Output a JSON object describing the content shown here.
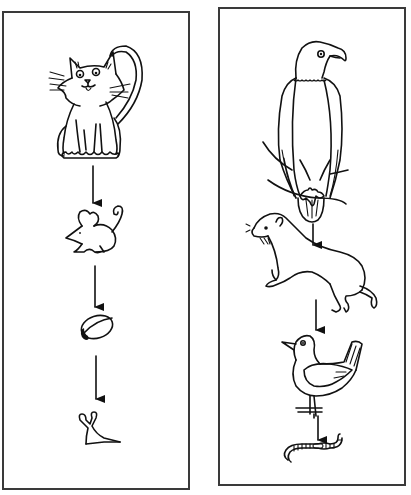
{
  "diagram": {
    "type": "food-chains",
    "arrow_direction": "predator-to-prey (downward)",
    "panels": [
      {
        "id": "left",
        "organisms": [
          {
            "name": "cat",
            "icon": "cat-icon"
          },
          {
            "name": "mouse",
            "icon": "mouse-icon"
          },
          {
            "name": "seed",
            "icon": "seed-icon"
          },
          {
            "name": "slug",
            "icon": "slug-icon"
          }
        ]
      },
      {
        "id": "right",
        "organisms": [
          {
            "name": "eagle",
            "icon": "eagle-icon"
          },
          {
            "name": "stoat",
            "icon": "stoat-icon"
          },
          {
            "name": "bird",
            "icon": "bird-icon"
          },
          {
            "name": "worm",
            "icon": "worm-icon"
          }
        ]
      }
    ]
  },
  "colors": {
    "ink": "#111111",
    "border": "#3a3a3a",
    "background": "#ffffff"
  }
}
